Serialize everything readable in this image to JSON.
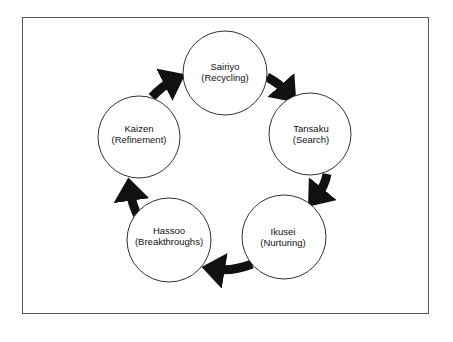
{
  "diagram": {
    "type": "cycle",
    "direction": "clockwise",
    "nodes": [
      {
        "id": "sairiyo",
        "title": "Sairiyo",
        "subtitle": "(Recycling)"
      },
      {
        "id": "tansaku",
        "title": "Tansaku",
        "subtitle": "(Search)"
      },
      {
        "id": "ikusei",
        "title": "Ikusei",
        "subtitle": "(Nurturing)"
      },
      {
        "id": "hassoo",
        "title": "Hassoo",
        "subtitle": "(Breakthroughs)"
      },
      {
        "id": "kaizen",
        "title": "Kaizen",
        "subtitle": "(Refinement)"
      }
    ],
    "edges": [
      {
        "from": "sairiyo",
        "to": "tansaku"
      },
      {
        "from": "tansaku",
        "to": "ikusei"
      },
      {
        "from": "ikusei",
        "to": "hassoo"
      },
      {
        "from": "hassoo",
        "to": "kaizen"
      },
      {
        "from": "kaizen",
        "to": "sairiyo"
      }
    ],
    "colors": {
      "arrow": "#111111",
      "circle_stroke": "#333333",
      "frame": "#555555"
    }
  }
}
